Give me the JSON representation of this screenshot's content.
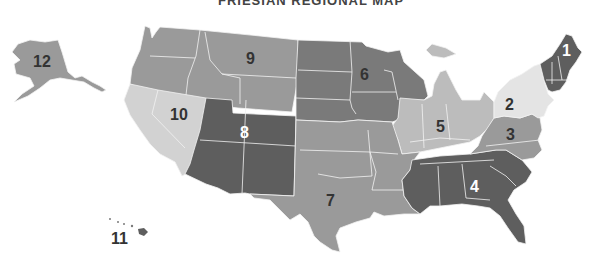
{
  "title": "FRIESIAN REGIONAL MAP",
  "colors": {
    "dark": "#5e5e5e",
    "mid_dark": "#7a7a7a",
    "mid": "#9a9a9a",
    "light": "#bcbcbc",
    "lighter": "#d2d2d2",
    "lightest": "#e4e4e4",
    "border": "#f2f2f2"
  },
  "regions": [
    {
      "id": 1,
      "label": "1",
      "shade": "dark",
      "states": "New England (ME, NH, VT, MA, CT, RI)"
    },
    {
      "id": 2,
      "label": "2",
      "shade": "lightest",
      "states": "NY, PA, NJ"
    },
    {
      "id": 3,
      "label": "3",
      "shade": "mid",
      "states": "VA, WV, MD, DE, NC"
    },
    {
      "id": 4,
      "label": "4",
      "shade": "dark",
      "states": "TN, MS, AL, GA, SC, FL"
    },
    {
      "id": 5,
      "label": "5",
      "shade": "light",
      "states": "MI, IL, IN, OH, KY"
    },
    {
      "id": 6,
      "label": "6",
      "shade": "mid_dark",
      "states": "ND, SD, NE, MN, IA, WI"
    },
    {
      "id": 7,
      "label": "7",
      "shade": "mid",
      "states": "KS, OK, TX, MO, AR, LA"
    },
    {
      "id": 8,
      "label": "8",
      "shade": "dark",
      "states": "UT, CO, AZ, NM"
    },
    {
      "id": 9,
      "label": "9",
      "shade": "mid",
      "states": "WA, OR, ID, MT, WY"
    },
    {
      "id": 10,
      "label": "10",
      "shade": "lighter",
      "states": "CA, NV"
    },
    {
      "id": 11,
      "label": "11",
      "shade": "dark",
      "states": "HI"
    },
    {
      "id": 12,
      "label": "12",
      "shade": "mid",
      "states": "AK"
    }
  ]
}
